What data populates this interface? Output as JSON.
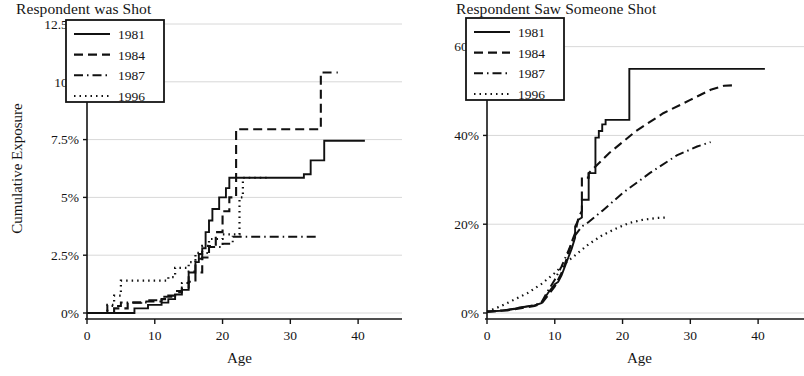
{
  "figure": {
    "width": 804,
    "height": 376,
    "background": "#ffffff",
    "line_color": "#111111",
    "grid_color": "#d8d8d8"
  },
  "panels": [
    {
      "id": "respondent-was-shot",
      "title": "Respondent was Shot",
      "ylabel": "Cumulative Exposure",
      "xlabel": "Age"
    },
    {
      "id": "respondent-saw-someone-shot",
      "title": "Respondent Saw Someone Shot",
      "ylabel": "",
      "xlabel": "Age"
    }
  ],
  "legend": {
    "entries": [
      {
        "label": "1981",
        "style": "solid"
      },
      {
        "label": "1984",
        "style": "dashed"
      },
      {
        "label": "1987",
        "style": "dashdot"
      },
      {
        "label": "1996",
        "style": "dotted"
      }
    ]
  },
  "chart_data": [
    {
      "type": "line",
      "title": "Respondent was Shot",
      "xlabel": "Age",
      "ylabel": "Cumulative Exposure",
      "xlim": [
        0,
        45
      ],
      "ylim": [
        0,
        12.5
      ],
      "xticks": [
        0,
        10,
        20,
        30,
        40
      ],
      "xtick_labels": [
        "0",
        "10",
        "20",
        "30",
        "40"
      ],
      "yticks": [
        0,
        2.5,
        5,
        7.5,
        10,
        12.5
      ],
      "ytick_labels": [
        "0%",
        "2.5%",
        "5%",
        "7.5%",
        "10%",
        "12.5%"
      ],
      "grid": "horizontal",
      "legend_position": "top-left",
      "series": [
        {
          "name": "1981",
          "style": "solid",
          "points": [
            [
              0,
              0.0
            ],
            [
              7,
              0.0
            ],
            [
              7,
              0.2
            ],
            [
              9,
              0.2
            ],
            [
              9,
              0.35
            ],
            [
              11,
              0.35
            ],
            [
              11,
              0.45
            ],
            [
              12,
              0.45
            ],
            [
              12,
              0.6
            ],
            [
              13,
              0.6
            ],
            [
              13,
              0.8
            ],
            [
              14,
              0.8
            ],
            [
              14,
              1.0
            ],
            [
              15,
              1.0
            ],
            [
              15,
              1.75
            ],
            [
              16,
              1.75
            ],
            [
              16,
              2.2
            ],
            [
              16.5,
              2.2
            ],
            [
              16.5,
              2.55
            ],
            [
              17,
              2.55
            ],
            [
              17,
              2.8
            ],
            [
              17.5,
              2.8
            ],
            [
              17.5,
              3.5
            ],
            [
              18,
              3.5
            ],
            [
              18,
              4.0
            ],
            [
              18.5,
              4.0
            ],
            [
              18.5,
              4.5
            ],
            [
              19.5,
              4.5
            ],
            [
              19.5,
              5.0
            ],
            [
              20.5,
              5.0
            ],
            [
              20.5,
              5.4
            ],
            [
              21,
              5.4
            ],
            [
              21,
              5.85
            ],
            [
              32,
              5.85
            ],
            [
              32,
              6.0
            ],
            [
              33,
              6.0
            ],
            [
              33,
              6.6
            ],
            [
              35,
              6.6
            ],
            [
              35,
              7.45
            ],
            [
              41,
              7.45
            ]
          ]
        },
        {
          "name": "1984",
          "style": "dashed",
          "points": [
            [
              0,
              0.0
            ],
            [
              4,
              0.0
            ],
            [
              4,
              0.2
            ],
            [
              6,
              0.2
            ],
            [
              6,
              0.45
            ],
            [
              8,
              0.45
            ],
            [
              8,
              0.5
            ],
            [
              11,
              0.5
            ],
            [
              11,
              0.6
            ],
            [
              12,
              0.6
            ],
            [
              12,
              0.75
            ],
            [
              13,
              0.75
            ],
            [
              13,
              0.9
            ],
            [
              14,
              0.9
            ],
            [
              14,
              1.1
            ],
            [
              15,
              1.1
            ],
            [
              15,
              1.35
            ],
            [
              16,
              1.35
            ],
            [
              16,
              1.75
            ],
            [
              17,
              1.75
            ],
            [
              17,
              2.4
            ],
            [
              18,
              2.4
            ],
            [
              18,
              2.9
            ],
            [
              19,
              2.9
            ],
            [
              19,
              3.5
            ],
            [
              20,
              3.5
            ],
            [
              20,
              4.4
            ],
            [
              21,
              4.4
            ],
            [
              21,
              5.0
            ],
            [
              22,
              5.0
            ],
            [
              22,
              7.95
            ],
            [
              34.5,
              7.95
            ],
            [
              34.5,
              10.4
            ],
            [
              37,
              10.4
            ]
          ]
        },
        {
          "name": "1987",
          "style": "dashdot",
          "points": [
            [
              0,
              0.0
            ],
            [
              3,
              0.0
            ],
            [
              3,
              0.3
            ],
            [
              5,
              0.3
            ],
            [
              5,
              0.45
            ],
            [
              9,
              0.45
            ],
            [
              9,
              0.55
            ],
            [
              11,
              0.55
            ],
            [
              11,
              0.7
            ],
            [
              13,
              0.7
            ],
            [
              13,
              0.95
            ],
            [
              14,
              0.95
            ],
            [
              14,
              1.3
            ],
            [
              15,
              1.3
            ],
            [
              15,
              1.8
            ],
            [
              16,
              1.8
            ],
            [
              16,
              2.35
            ],
            [
              17,
              2.35
            ],
            [
              17,
              2.6
            ],
            [
              18,
              2.6
            ],
            [
              18,
              2.85
            ],
            [
              20,
              2.85
            ],
            [
              20,
              3.0
            ],
            [
              21.5,
              3.0
            ],
            [
              21.5,
              3.3
            ],
            [
              34,
              3.3
            ]
          ]
        },
        {
          "name": "1996",
          "style": "dotted",
          "points": [
            [
              0,
              0.0
            ],
            [
              3,
              0.0
            ],
            [
              3,
              0.35
            ],
            [
              4,
              0.35
            ],
            [
              4,
              0.75
            ],
            [
              5,
              0.75
            ],
            [
              5,
              1.4
            ],
            [
              12,
              1.4
            ],
            [
              12,
              1.55
            ],
            [
              13,
              1.55
            ],
            [
              13,
              1.95
            ],
            [
              15,
              1.95
            ],
            [
              15,
              2.2
            ],
            [
              16,
              2.2
            ],
            [
              16,
              2.6
            ],
            [
              17,
              2.6
            ],
            [
              17,
              2.9
            ],
            [
              18,
              2.9
            ],
            [
              18,
              3.2
            ],
            [
              20,
              3.2
            ],
            [
              20,
              3.4
            ],
            [
              22.5,
              3.4
            ],
            [
              22.5,
              5.0
            ],
            [
              23,
              5.0
            ],
            [
              23,
              5.85
            ],
            [
              26.5,
              5.85
            ]
          ]
        }
      ]
    },
    {
      "type": "line",
      "title": "Respondent Saw Someone Shot",
      "xlabel": "Age",
      "ylabel": "",
      "xlim": [
        0,
        45
      ],
      "ylim": [
        0,
        66
      ],
      "xticks": [
        0,
        10,
        20,
        30,
        40
      ],
      "xtick_labels": [
        "0",
        "10",
        "20",
        "30",
        "40"
      ],
      "yticks": [
        0,
        20,
        40,
        60
      ],
      "ytick_labels": [
        "0%",
        "20%",
        "40%",
        "60%"
      ],
      "grid": "horizontal",
      "legend_position": "top-left",
      "series": [
        {
          "name": "1981",
          "style": "solid",
          "points": [
            [
              0,
              0.3
            ],
            [
              2,
              0.5
            ],
            [
              4,
              0.9
            ],
            [
              5,
              1.3
            ],
            [
              6,
              1.5
            ],
            [
              7,
              1.7
            ],
            [
              8,
              2.2
            ],
            [
              9,
              4.5
            ],
            [
              10,
              6.5
            ],
            [
              10.5,
              7.0
            ],
            [
              11,
              8.5
            ],
            [
              12,
              12.5
            ],
            [
              12.5,
              14.5
            ],
            [
              13,
              17.0
            ],
            [
              13,
              19.5
            ],
            [
              13.5,
              21.0
            ],
            [
              14,
              21.5
            ],
            [
              14,
              25.5
            ],
            [
              15,
              25.5
            ],
            [
              15,
              31.5
            ],
            [
              16,
              31.5
            ],
            [
              16,
              39.5
            ],
            [
              16.5,
              39.5
            ],
            [
              16.5,
              41.0
            ],
            [
              17,
              41.0
            ],
            [
              17,
              42.5
            ],
            [
              17.5,
              42.5
            ],
            [
              17.5,
              43.5
            ],
            [
              21,
              43.5
            ],
            [
              21,
              55.0
            ],
            [
              41,
              55.0
            ]
          ]
        },
        {
          "name": "1984",
          "style": "dashed",
          "points": [
            [
              0,
              0.3
            ],
            [
              3,
              0.6
            ],
            [
              5,
              1.1
            ],
            [
              7,
              1.6
            ],
            [
              8,
              2.0
            ],
            [
              9,
              4.0
            ],
            [
              10,
              6.0
            ],
            [
              11,
              9.0
            ],
            [
              11.5,
              11.0
            ],
            [
              12,
              13.5
            ],
            [
              12.5,
              16.0
            ],
            [
              13,
              18.0
            ],
            [
              13.5,
              21.5
            ],
            [
              14,
              23.0
            ],
            [
              14,
              30.5
            ],
            [
              15,
              30.5
            ],
            [
              15,
              31.5
            ],
            [
              18,
              36.0
            ],
            [
              22,
              41.0
            ],
            [
              26,
              45.0
            ],
            [
              30,
              48.0
            ],
            [
              33,
              50.3
            ],
            [
              35,
              51.2
            ],
            [
              36.5,
              51.3
            ]
          ]
        },
        {
          "name": "1987",
          "style": "dashdot",
          "points": [
            [
              0,
              0.3
            ],
            [
              3,
              0.7
            ],
            [
              5,
              1.2
            ],
            [
              7,
              1.8
            ],
            [
              8,
              2.3
            ],
            [
              9,
              5.0
            ],
            [
              10,
              7.5
            ],
            [
              11,
              10.5
            ],
            [
              12,
              14.0
            ],
            [
              13,
              17.5
            ],
            [
              14,
              19.5
            ],
            [
              15,
              20.5
            ],
            [
              17,
              23.0
            ],
            [
              20,
              27.0
            ],
            [
              24,
              31.5
            ],
            [
              28,
              35.5
            ],
            [
              31,
              37.5
            ],
            [
              33,
              38.5
            ]
          ]
        },
        {
          "name": "1996",
          "style": "dotted",
          "points": [
            [
              0,
              0.3
            ],
            [
              2,
              1.5
            ],
            [
              4,
              3.0
            ],
            [
              6,
              4.5
            ],
            [
              8,
              6.5
            ],
            [
              10,
              9.0
            ],
            [
              11,
              10.5
            ],
            [
              13,
              13.0
            ],
            [
              15,
              15.5
            ],
            [
              17,
              17.5
            ],
            [
              19,
              19.0
            ],
            [
              21,
              20.3
            ],
            [
              23,
              21.0
            ],
            [
              25,
              21.4
            ],
            [
              26.5,
              21.5
            ]
          ]
        }
      ]
    }
  ]
}
